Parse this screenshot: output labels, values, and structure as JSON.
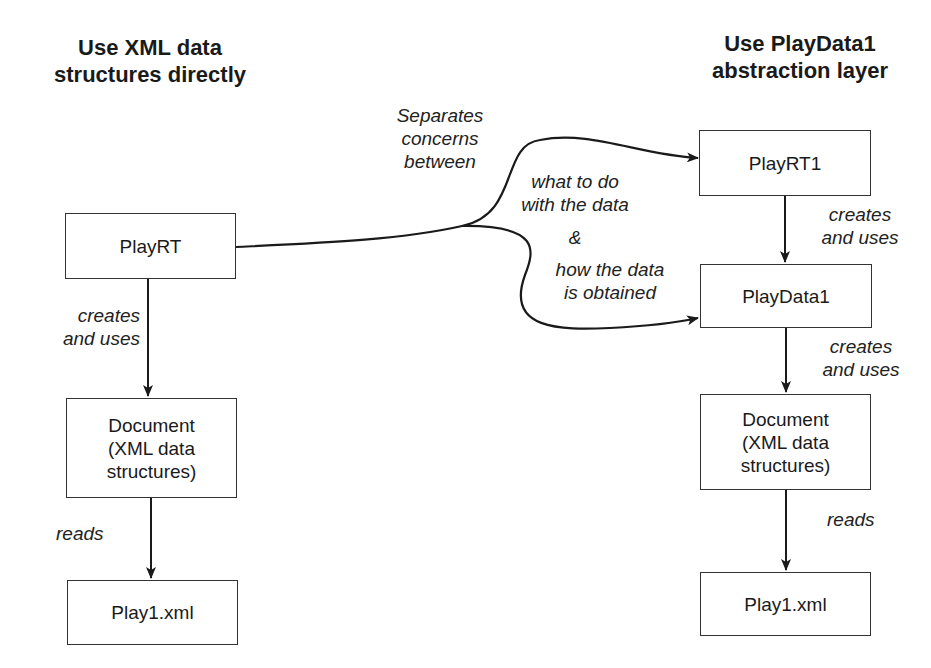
{
  "left": {
    "heading": "Use XML data\nstructures directly",
    "boxes": {
      "playrt": "PlayRT",
      "document": "Document\n(XML data\nstructures)",
      "play1": "Play1.xml"
    },
    "labels": {
      "creates_uses": "creates\nand uses",
      "reads": "reads"
    }
  },
  "right": {
    "heading": "Use PlayData1\nabstraction layer",
    "boxes": {
      "playrt1": "PlayRT1",
      "playdata1": "PlayData1",
      "document": "Document\n(XML data\nstructures)",
      "play1": "Play1.xml"
    },
    "labels": {
      "creates_uses_1": "creates\nand uses",
      "creates_uses_2": "creates\nand uses",
      "reads": "reads"
    }
  },
  "middle": {
    "separates": "Separates\nconcerns\nbetween",
    "what": "what to do\nwith the data",
    "amp": "&",
    "how": "how the data\nis obtained"
  }
}
